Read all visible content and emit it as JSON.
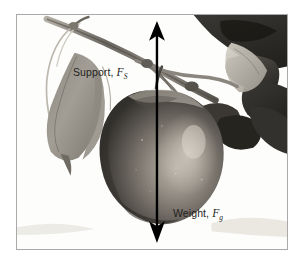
{
  "figure": {
    "caption_alt": "Apple hanging from a branch with support and weight force vectors",
    "frame_color": "#a9a9a9",
    "background_color": "#ffffff"
  },
  "labels": {
    "support": {
      "text": "Support,",
      "symbol": "F",
      "subscript": "S",
      "full": "Support, FS",
      "color": "#231f20"
    },
    "weight": {
      "text": "Weight,",
      "symbol": "F",
      "subscript": "g",
      "full": "Weight, Fg",
      "color": "#231f20"
    }
  },
  "arrows": {
    "support_arrow": {
      "direction": "up",
      "tip_y": 25,
      "tail_y": 142,
      "x": 157,
      "color": "#000000"
    },
    "weight_arrow": {
      "direction": "down",
      "tip_y": 231,
      "tail_y": 142,
      "x": 157,
      "color": "#000000"
    }
  },
  "photo_elements": {
    "apple": "apple",
    "branch": "branch",
    "leaf_left": "hanging-leaf",
    "leaves_right": "leaf-cluster",
    "stem": "apple-stem"
  }
}
